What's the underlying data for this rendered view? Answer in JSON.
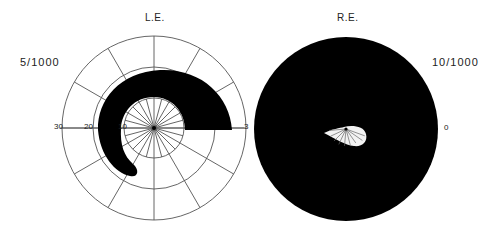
{
  "figure": {
    "left_eye": {
      "title": "L.E.",
      "acuity": "5/1000",
      "ring_labels": [
        "10",
        "20",
        "30"
      ],
      "right_meridian_label": "3",
      "scotoma": "arcuate defect sweeping superiorly from the temporal horizontal meridian around fixation to inferonasal field"
    },
    "right_eye": {
      "title": "R.E.",
      "acuity": "10/1000",
      "right_meridian_label": "0",
      "scotoma": "near-total field loss with small central island of preserved vision"
    },
    "colors": {
      "ink": "#000000",
      "grid": "#555555",
      "background": "#ffffff"
    }
  }
}
